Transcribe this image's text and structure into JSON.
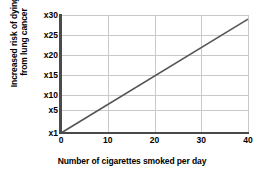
{
  "chart_data": {
    "type": "line",
    "title": "",
    "xlabel": "Number of cigarettes smoked per day",
    "ylabel_lines": [
      "Increased risk of dying",
      "from lung cancer"
    ],
    "ylabel": "Increased risk of dying from lung cancer",
    "x": [
      0,
      40
    ],
    "values": [
      1,
      29
    ],
    "series": [
      {
        "name": "Increased risk of dying from lung cancer",
        "x": [
          0,
          40
        ],
        "values": [
          1,
          29
        ],
        "color": "#555555"
      }
    ],
    "xlim": [
      0,
      40
    ],
    "ylim": [
      1,
      30
    ],
    "xticks": [
      0,
      10,
      20,
      30,
      40
    ],
    "xtick_labels": [
      "0",
      "10",
      "20",
      "30",
      "40"
    ],
    "yticks": [
      1,
      5,
      10,
      15,
      20,
      25,
      30
    ],
    "ytick_labels": [
      "x1",
      "x5",
      "x10",
      "x15",
      "x20",
      "x25",
      "x30"
    ],
    "grid": true,
    "grid_color": "#c9c9c9",
    "axis_color": "#4a4a4a",
    "legend": "none",
    "background": "#ffffff"
  }
}
